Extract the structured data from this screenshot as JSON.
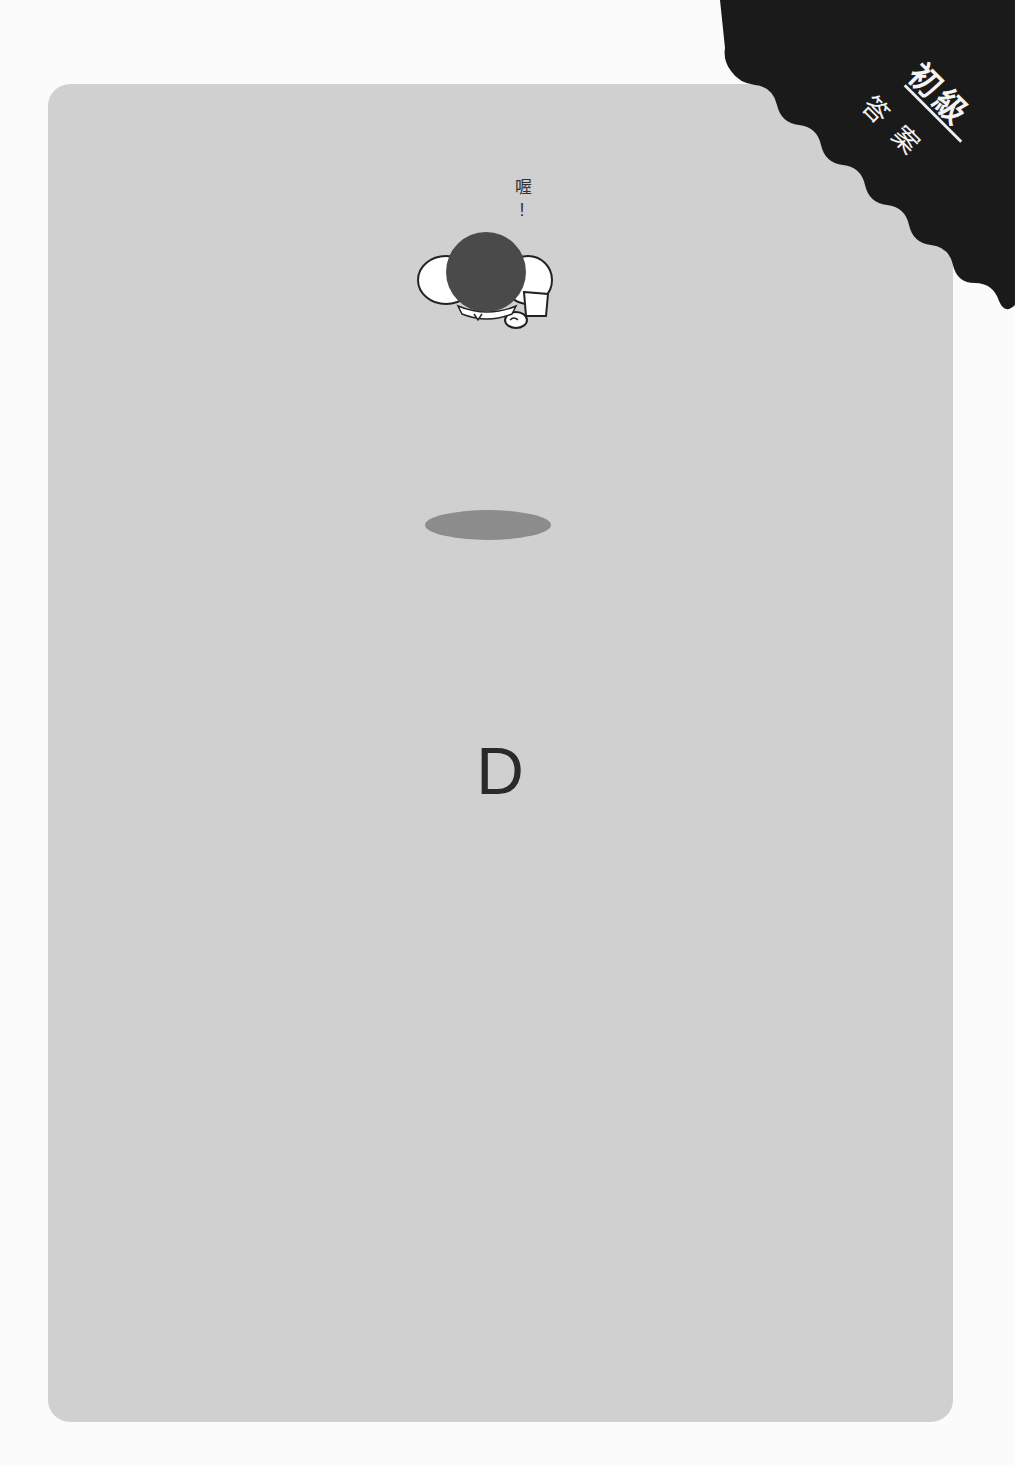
{
  "page": {
    "background_color": "#fbfbfb",
    "card_color": "#d0d0d0"
  },
  "corner_tag": {
    "level": "初級",
    "label": "答案",
    "color": "#1a1a1a"
  },
  "illustration": {
    "speech_word": "喔",
    "speech_mark": "!",
    "description": "person seen from above, bowing",
    "shadow_color": "#8c8c8c"
  },
  "answer": {
    "letter": "D"
  }
}
